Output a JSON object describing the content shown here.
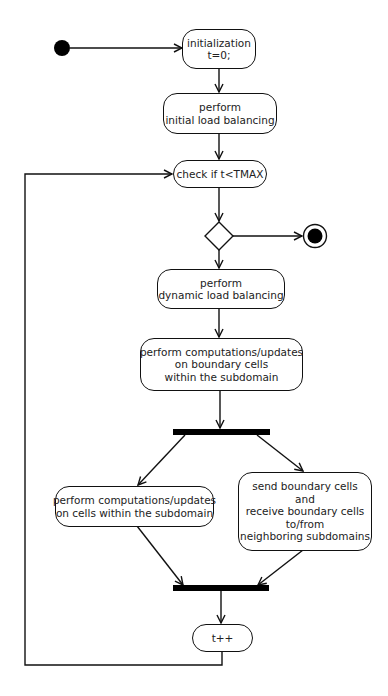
{
  "diagram": {
    "type": "UML activity diagram",
    "nodes": {
      "init": {
        "lines": [
          "initialization",
          "t=0;"
        ]
      },
      "initial_lb": {
        "lines": [
          "perform",
          "initial load balancing"
        ]
      },
      "check": {
        "lines": [
          "check if t<TMAX"
        ]
      },
      "dynamic_lb": {
        "lines": [
          "perform",
          "dynamic load balancing"
        ]
      },
      "boundary": {
        "lines": [
          "perform computations/updates",
          "on boundary cells",
          "within the subdomain"
        ]
      },
      "inner": {
        "lines": [
          "perform computations/updates",
          "on cells within the subdomain"
        ]
      },
      "exchange": {
        "lines": [
          "send boundary cells",
          "and",
          "receive boundary cells",
          "to/from",
          "neighboring subdomains"
        ]
      },
      "increment": {
        "lines": [
          "t++"
        ]
      }
    },
    "colors": {
      "stroke": "#111111",
      "fill": "#ffffff",
      "text": "#222222"
    }
  }
}
